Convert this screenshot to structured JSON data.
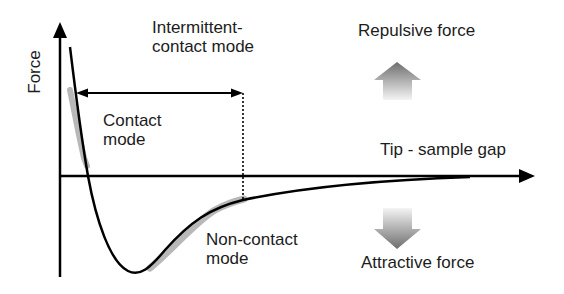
{
  "diagram": {
    "y_axis_label": "Force",
    "x_axis_label": "Tip - sample gap",
    "regions": {
      "intermittent": {
        "line1": "Intermittent-",
        "line2": "contact mode"
      },
      "contact": {
        "line1": "Contact",
        "line2": "mode"
      },
      "non_contact": {
        "line1": "Non-contact",
        "line2": "mode"
      }
    },
    "force_indicators": {
      "repulsive": {
        "label": "Repulsive force",
        "direction": "up"
      },
      "attractive": {
        "label": "Attractive force",
        "direction": "down"
      }
    },
    "colors": {
      "axis": "#000000",
      "curve": "#000000",
      "highlight": "#b8b8b8",
      "arrow_dark": "#6e6e6e",
      "arrow_light": "#f2f2f2",
      "text": "#1c1c1c"
    }
  }
}
